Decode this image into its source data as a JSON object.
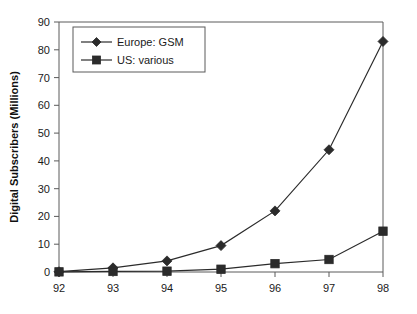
{
  "chart_data": {
    "type": "line",
    "title": "",
    "xlabel": "",
    "ylabel": "Digital Subscribers (Millions)",
    "x": [
      "92",
      "93",
      "94",
      "95",
      "96",
      "97",
      "98"
    ],
    "categories": [
      "92",
      "93",
      "94",
      "95",
      "96",
      "97",
      "98"
    ],
    "xlim": [
      92,
      98
    ],
    "ylim": [
      0,
      90
    ],
    "yticks": [
      "0",
      "10",
      "20",
      "30",
      "40",
      "50",
      "60",
      "70",
      "80",
      "90"
    ],
    "ytick_values": [
      0,
      10,
      20,
      30,
      40,
      50,
      60,
      70,
      80,
      90
    ],
    "grid": false,
    "legend_position": "top-left",
    "series": [
      {
        "name": "Europe: GSM",
        "marker": "diamond",
        "color": "#2b2b2b",
        "values": [
          0.1,
          1.5,
          4.0,
          9.5,
          22.0,
          44.0,
          83.0
        ]
      },
      {
        "name": "US: various",
        "marker": "square",
        "color": "#2b2b2b",
        "values": [
          0.05,
          0.2,
          0.3,
          1.0,
          3.0,
          4.5,
          14.7
        ]
      }
    ]
  },
  "legend": {
    "items": [
      {
        "label": "Europe: GSM",
        "marker": "diamond"
      },
      {
        "label": "US: various",
        "marker": "square"
      }
    ]
  },
  "axes": {
    "y_title": "Digital Subscribers (Millions)",
    "y_ticks": [
      "90",
      "80",
      "70",
      "60",
      "50",
      "40",
      "30",
      "20",
      "10",
      "0"
    ],
    "x_ticks": [
      "92",
      "93",
      "94",
      "95",
      "96",
      "97",
      "98"
    ]
  }
}
